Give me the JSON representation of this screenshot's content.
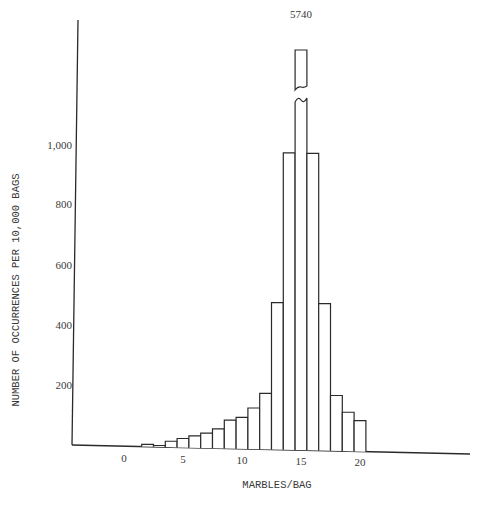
{
  "chart_data": {
    "type": "bar",
    "title": "",
    "xlabel": "MARBLES/BAG",
    "ylabel": "NUMBER OF OCCURRENCES PER 10,000 BAGS",
    "x_tick_labels": [
      "0",
      "5",
      "10",
      "15",
      "20"
    ],
    "x_ticks": [
      0,
      5,
      10,
      15,
      20
    ],
    "y_tick_labels": [
      "200",
      "400",
      "600",
      "800",
      "1,000"
    ],
    "y_ticks": [
      200,
      400,
      600,
      800,
      1000
    ],
    "ylim": [
      0,
      1000
    ],
    "grid": false,
    "legend": null,
    "categories": [
      2,
      3,
      4,
      5,
      6,
      7,
      8,
      9,
      10,
      11,
      12,
      13,
      14,
      15,
      16,
      17,
      18,
      19,
      20
    ],
    "values": [
      8,
      5,
      20,
      30,
      40,
      50,
      65,
      95,
      105,
      137,
      187,
      490,
      990,
      5740,
      990,
      490,
      185,
      130,
      103
    ],
    "annotations": [
      {
        "text": "5740",
        "target_category": 15,
        "note": "bar truncated with axis break"
      }
    ]
  }
}
